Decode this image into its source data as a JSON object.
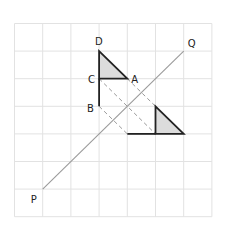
{
  "figure": {
    "grid": {
      "columns": 7,
      "rows": 7
    },
    "labels": {
      "P": "P",
      "Q": "Q",
      "A": "A",
      "B": "B",
      "C": "C",
      "D": "D"
    },
    "colors": {
      "grid": "#e2e2e2",
      "shape_fill": "#dcdcdc",
      "shape_stroke": "#222222",
      "mirror_line": "#9a9a9a",
      "dashed_line": "#9a9a9a",
      "label": "#222222"
    },
    "points_grid_units": {
      "P": [
        1,
        6
      ],
      "Q": [
        6,
        1
      ],
      "D": [
        3,
        1
      ],
      "C": [
        3,
        2
      ],
      "A": [
        4,
        2
      ],
      "B": [
        3,
        3
      ],
      "D_image": [
        6,
        4
      ],
      "C_image": [
        5,
        4
      ],
      "A_image": [
        5,
        3
      ],
      "B_image": [
        4,
        4
      ]
    },
    "mirror_line": [
      "P",
      "Q"
    ],
    "original_triangle": [
      "D",
      "C",
      "A"
    ],
    "original_segment": [
      "C",
      "B"
    ],
    "image_triangle": [
      "A_image",
      "C_image",
      "D_image"
    ],
    "image_segment": [
      "C_image",
      "B_image"
    ],
    "construction_lines": [
      [
        "C",
        "C_image"
      ],
      [
        "A",
        "A_image"
      ],
      [
        "B",
        "B_image"
      ]
    ]
  }
}
